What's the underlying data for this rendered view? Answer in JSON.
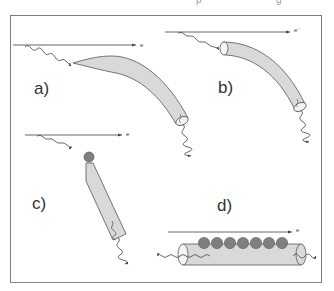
{
  "figure": {
    "colors": {
      "frame": "#7a7a7a",
      "fill": "#d9d9d9",
      "outline": "#555555",
      "sphere": "#7f7f7f",
      "text": "#333333"
    },
    "panels": [
      {
        "id": "a",
        "label": "a)",
        "beam_label": "e",
        "description": "laser pulse entering a tapered, curved channel"
      },
      {
        "id": "b",
        "label": "b)",
        "beam_label": "e⁻",
        "description": "laser pulse guided through a curved tube"
      },
      {
        "id": "c",
        "label": "c)",
        "beam_label": "e",
        "description": "laser pulse hitting a sphere at the tip of a tapered rod"
      },
      {
        "id": "d",
        "label": "d)",
        "beam_label": "e",
        "description": "straight cylinder with a row of seven spheres on top"
      }
    ],
    "panel_d_sphere_count": 7
  }
}
